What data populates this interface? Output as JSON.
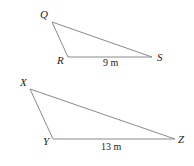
{
  "diagram": {
    "triangles": [
      {
        "name": "QRS",
        "vertices": [
          {
            "label": "Q",
            "x": 52,
            "y": 22,
            "lx": 40,
            "ly": 18
          },
          {
            "label": "R",
            "x": 68,
            "y": 57,
            "lx": 57,
            "ly": 64
          },
          {
            "label": "S",
            "x": 152,
            "y": 57,
            "lx": 157,
            "ly": 61
          }
        ],
        "side_label": {
          "text": "9 m",
          "x": 103,
          "y": 66
        }
      },
      {
        "name": "XYZ",
        "vertices": [
          {
            "label": "X",
            "x": 30,
            "y": 89,
            "lx": 20,
            "ly": 86
          },
          {
            "label": "Y",
            "x": 53,
            "y": 139,
            "lx": 43,
            "ly": 145
          },
          {
            "label": "Z",
            "x": 175,
            "y": 139,
            "lx": 178,
            "ly": 143
          }
        ],
        "side_label": {
          "text": "13 m",
          "x": 101,
          "y": 150
        }
      }
    ],
    "edge_color": "#8a8a8a"
  }
}
